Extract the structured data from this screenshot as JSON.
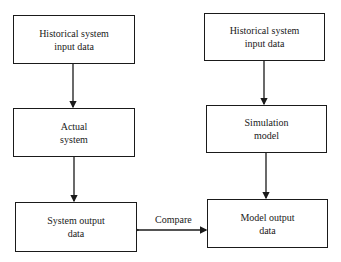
{
  "diagram": {
    "left_column": [
      {
        "id": "hist-input-left",
        "label": "Historical system\ninput data"
      },
      {
        "id": "actual-system",
        "label": "Actual\nsystem"
      },
      {
        "id": "system-output",
        "label": "System output\ndata"
      }
    ],
    "right_column": [
      {
        "id": "hist-input-right",
        "label": "Historical system\ninput data"
      },
      {
        "id": "simulation-model",
        "label": "Simulation\nmodel"
      },
      {
        "id": "model-output",
        "label": "Model output\ndata"
      }
    ],
    "edges": [
      {
        "from": "hist-input-left",
        "to": "actual-system",
        "type": "arrow"
      },
      {
        "from": "actual-system",
        "to": "system-output",
        "type": "arrow"
      },
      {
        "from": "hist-input-right",
        "to": "simulation-model",
        "type": "arrow"
      },
      {
        "from": "simulation-model",
        "to": "model-output",
        "type": "arrow"
      },
      {
        "from": "system-output",
        "to": "model-output",
        "type": "bidirectional-arrow",
        "label": "Compare"
      }
    ],
    "compare_label": "Compare"
  }
}
